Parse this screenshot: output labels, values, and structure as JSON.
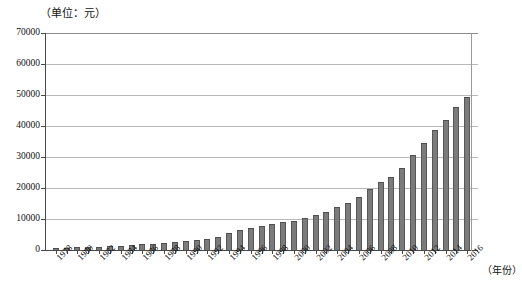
{
  "chart_data": {
    "type": "bar",
    "title": "",
    "unit_caption": "（单位：元）",
    "xlabel": "（年份）",
    "ylabel": "",
    "ylim": [
      0,
      70000
    ],
    "y_ticks": [
      0,
      10000,
      20000,
      30000,
      40000,
      50000,
      60000,
      70000
    ],
    "y_tick_labels": [
      "0",
      "10000",
      "20000",
      "30000",
      "40000",
      "50000",
      "60000",
      "70000"
    ],
    "grid": true,
    "legend": null,
    "x_tick_labels": [
      "1978",
      "1980",
      "1982",
      "1984",
      "1986",
      "1988",
      "1990",
      "1992",
      "1994",
      "1996",
      "1998",
      "2000",
      "2002",
      "2004",
      "2006",
      "2008",
      "2010",
      "2012",
      "2014",
      "2016"
    ],
    "categories": [
      "1978",
      "1979",
      "1980",
      "1981",
      "1982",
      "1983",
      "1984",
      "1985",
      "1986",
      "1987",
      "1988",
      "1989",
      "1990",
      "1991",
      "1992",
      "1993",
      "1994",
      "1995",
      "1996",
      "1997",
      "1998",
      "1999",
      "2000",
      "2001",
      "2002",
      "2003",
      "2004",
      "2005",
      "2006",
      "2007",
      "2008",
      "2009",
      "2010",
      "2011",
      "2012",
      "2013",
      "2014",
      "2015",
      "2016"
    ],
    "values": [
      615,
      705,
      860,
      980,
      1050,
      1150,
      1350,
      1600,
      1800,
      2000,
      2400,
      2650,
      2800,
      3100,
      3600,
      4300,
      5500,
      6500,
      7200,
      7800,
      8300,
      8900,
      9500,
      10300,
      11400,
      12400,
      13800,
      15200,
      17000,
      19600,
      21800,
      23600,
      26500,
      30600,
      34400,
      38600,
      42000,
      46000,
      49500
    ]
  },
  "colors": {
    "bar_fill": "#7b7b7b",
    "bar_edge": "#565656",
    "gridline": "#b9b9b9",
    "axis": "#4a4a4a",
    "text": "#111111",
    "background": "#ffffff"
  }
}
